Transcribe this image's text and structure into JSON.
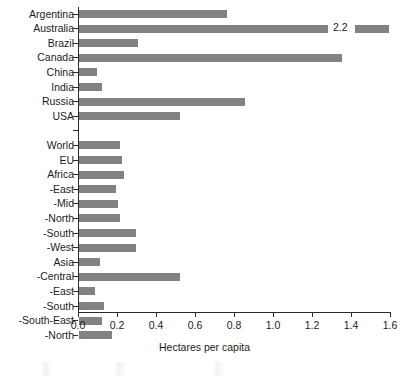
{
  "chart_data": {
    "type": "bar",
    "orientation": "horizontal",
    "title": "",
    "xlabel": "Hectares per capita",
    "ylabel": "",
    "xlim": [
      0.0,
      1.6
    ],
    "xticks": [
      "0.0",
      "0.2",
      "0.4",
      "0.6",
      "0.8",
      "1.0",
      "1.2",
      "1.4",
      "1.6"
    ],
    "xtick_values": [
      0.0,
      0.2,
      0.4,
      0.6,
      0.8,
      1.0,
      1.2,
      1.4,
      1.6
    ],
    "grid": false,
    "legend": null,
    "bar_color": "#828282",
    "axis_color": "#2b2b2b",
    "categories": [
      "Argentina",
      "Australia",
      "Brazil",
      "Canada",
      "China",
      "India",
      "Russia",
      "USA",
      "",
      "World",
      "EU",
      "Africa",
      "-East",
      "-Mid",
      "-North",
      "-South",
      "-West",
      "Asia",
      "-Central",
      "-East",
      "-South",
      "-South-East",
      "-North"
    ],
    "values": [
      0.76,
      2.2,
      0.3,
      1.35,
      0.09,
      0.12,
      0.85,
      0.52,
      null,
      0.21,
      0.22,
      0.23,
      0.19,
      0.2,
      0.21,
      0.29,
      0.29,
      0.11,
      0.52,
      0.08,
      0.13,
      0.12,
      0.17
    ],
    "annotations": [
      {
        "category": "Australia",
        "text": "2.2",
        "note": "value exceeds axis maximum; bar is broken and labelled with its true value"
      }
    ],
    "bars": [
      {
        "label": "Argentina",
        "value": 0.76,
        "broken": false
      },
      {
        "label": "Australia",
        "value": 2.2,
        "broken": true,
        "break_label": "2.2"
      },
      {
        "label": "Brazil",
        "value": 0.3,
        "broken": false
      },
      {
        "label": "Canada",
        "value": 1.35,
        "broken": false
      },
      {
        "label": "China",
        "value": 0.09,
        "broken": false
      },
      {
        "label": "India",
        "value": 0.12,
        "broken": false
      },
      {
        "label": "Russia",
        "value": 0.85,
        "broken": false
      },
      {
        "label": "USA",
        "value": 0.52,
        "broken": false
      },
      {
        "label": "",
        "value": null,
        "broken": false
      },
      {
        "label": "World",
        "value": 0.21,
        "broken": false
      },
      {
        "label": "EU",
        "value": 0.22,
        "broken": false
      },
      {
        "label": "Africa",
        "value": 0.23,
        "broken": false
      },
      {
        "label": "-East",
        "value": 0.19,
        "broken": false
      },
      {
        "label": "-Mid",
        "value": 0.2,
        "broken": false
      },
      {
        "label": "-North",
        "value": 0.21,
        "broken": false
      },
      {
        "label": "-South",
        "value": 0.29,
        "broken": false
      },
      {
        "label": "-West",
        "value": 0.29,
        "broken": false
      },
      {
        "label": "Asia",
        "value": 0.11,
        "broken": false
      },
      {
        "label": "-Central",
        "value": 0.52,
        "broken": false
      },
      {
        "label": "-East",
        "value": 0.08,
        "broken": false
      },
      {
        "label": "-South",
        "value": 0.13,
        "broken": false
      },
      {
        "label": "-South-East",
        "value": 0.12,
        "broken": false
      },
      {
        "label": "-North",
        "value": 0.17,
        "broken": false
      }
    ]
  }
}
